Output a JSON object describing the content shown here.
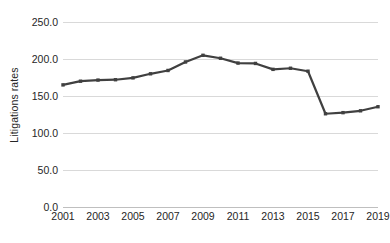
{
  "chart_data": {
    "type": "line",
    "title": "",
    "xlabel": "",
    "ylabel": "Litigations rates",
    "ylim": [
      0,
      250
    ],
    "xlim": [
      2001,
      2019
    ],
    "grid": true,
    "legend": false,
    "legend_position": "none",
    "series_color": "#404040",
    "gridline_color": "#d9d9d9",
    "axis_color": "#bfbfbf",
    "text_color": "#262626",
    "marker": "square",
    "x": [
      2001,
      2002,
      2003,
      2004,
      2005,
      2006,
      2007,
      2008,
      2009,
      2010,
      2011,
      2012,
      2013,
      2014,
      2015,
      2016,
      2017,
      2018,
      2019
    ],
    "values": [
      165.0,
      170.0,
      171.5,
      172.0,
      174.5,
      180.0,
      184.5,
      196.0,
      205.0,
      201.0,
      194.5,
      194.0,
      186.0,
      187.5,
      183.5,
      126.0,
      127.5,
      130.0,
      135.5
    ],
    "x_tick_labels": [
      "2001",
      "2003",
      "2005",
      "2007",
      "2009",
      "2011",
      "2013",
      "2015",
      "2017",
      "2019"
    ],
    "x_tick_values": [
      2001,
      2003,
      2005,
      2007,
      2009,
      2011,
      2013,
      2015,
      2017,
      2019
    ],
    "y_tick_labels": [
      "250.0",
      "200.0",
      "150.0",
      "100.0",
      "50.0",
      "0.0"
    ],
    "y_tick_values": [
      250,
      200,
      150,
      100,
      50,
      0
    ]
  }
}
